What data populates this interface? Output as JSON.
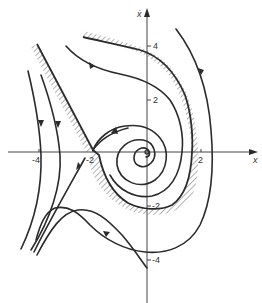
{
  "diagram": {
    "type": "phase-portrait",
    "axes": {
      "x_label": "x",
      "y_label": "ẋ",
      "x_ticks": [
        {
          "value": -4,
          "label": "-4"
        },
        {
          "value": -2,
          "label": "-2"
        },
        {
          "value": 2,
          "label": "2"
        }
      ],
      "y_ticks": [
        {
          "value": 4,
          "label": "4"
        },
        {
          "value": 2,
          "label": "2"
        },
        {
          "value": -2,
          "label": "-2"
        },
        {
          "value": -4,
          "label": "-4"
        }
      ]
    },
    "features": {
      "equilibrium_focus": "stable spiral at origin",
      "saddle_point": "saddle near x = -2",
      "separatrix": "hatched boundary of basin of attraction"
    },
    "colors": {
      "line": "#2b2b2b",
      "axis": "#444444",
      "background": "#ffffff"
    }
  }
}
